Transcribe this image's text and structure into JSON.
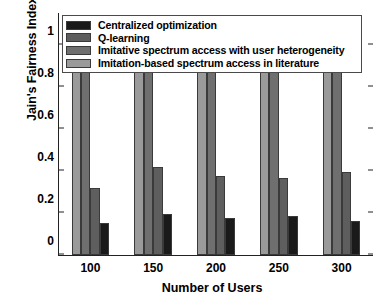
{
  "chart_data": {
    "type": "bar",
    "title": "",
    "xlabel": "Number of Users",
    "ylabel": "Jain's Fairness Index",
    "categories": [
      "100",
      "150",
      "200",
      "250",
      "300"
    ],
    "ylim": [
      0,
      1.15
    ],
    "yticks": [
      "0",
      "0.2",
      "0.4",
      "0.6",
      "0.8",
      "1"
    ],
    "ytick_values": [
      0,
      0.2,
      0.4,
      0.6,
      0.8,
      1
    ],
    "grid": false,
    "legend_position": "upper-left-inside",
    "series": [
      {
        "name": "Centralized optimization",
        "color": "#1a1a1a",
        "values": [
          0.15,
          0.195,
          0.175,
          0.185,
          0.16
        ]
      },
      {
        "name": "Q-learning",
        "color": "#5e5e5e",
        "values": [
          0.32,
          0.42,
          0.375,
          0.365,
          0.395
        ]
      },
      {
        "name": "Imitative spectrum access with user heterogeneity",
        "color": "#6f6f6f",
        "values": [
          0.97,
          0.955,
          0.945,
          0.952,
          0.935
        ]
      },
      {
        "name": "Imitation-based spectrum access in literature",
        "color": "#9a9a9a",
        "values": [
          0.948,
          0.925,
          0.915,
          0.945,
          0.905
        ]
      }
    ]
  },
  "legend": {
    "items": [
      {
        "label": "Centralized optimization",
        "color": "#1a1a1a"
      },
      {
        "label": "Q-learning",
        "color": "#5e5e5e"
      },
      {
        "label": "Imitative spectrum access with user heterogeneity",
        "color": "#6f6f6f"
      },
      {
        "label": "Imitation-based spectrum access in literature",
        "color": "#9a9a9a"
      }
    ]
  },
  "axes": {
    "x_title": "Number of Users",
    "y_title": "Jain's Fairness Index"
  }
}
